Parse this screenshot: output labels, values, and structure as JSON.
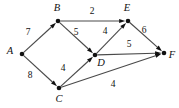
{
  "figure": {
    "type": "directed-weighted-graph",
    "width": 179,
    "height": 108,
    "background": "#ffffff",
    "edge_color": "#4a4a4a",
    "node_color": "#111111"
  },
  "nodes": [
    {
      "id": "A",
      "label": "A",
      "x": 22,
      "y": 54,
      "label_x": 10,
      "label_y": 52
    },
    {
      "id": "B",
      "label": "B",
      "x": 58,
      "y": 21,
      "label_x": 57,
      "label_y": 9
    },
    {
      "id": "C",
      "label": "C",
      "x": 59,
      "y": 88,
      "label_x": 59,
      "label_y": 100
    },
    {
      "id": "D",
      "label": "D",
      "x": 95,
      "y": 55,
      "label_x": 101,
      "label_y": 64
    },
    {
      "id": "E",
      "label": "E",
      "x": 128,
      "y": 21,
      "label_x": 127,
      "label_y": 9
    },
    {
      "id": "F",
      "label": "F",
      "x": 164,
      "y": 53,
      "label_x": 172,
      "label_y": 56
    }
  ],
  "edges": [
    {
      "id": "A-B",
      "from": "A",
      "to": "B",
      "weight": "7",
      "label_x": 28,
      "label_y": 33
    },
    {
      "id": "A-C",
      "from": "A",
      "to": "C",
      "weight": "8",
      "label_x": 30,
      "label_y": 76
    },
    {
      "id": "B-E",
      "from": "B",
      "to": "E",
      "weight": "2",
      "label_x": 92,
      "label_y": 12
    },
    {
      "id": "B-D",
      "from": "B",
      "to": "D",
      "weight": "5",
      "label_x": 76,
      "label_y": 33
    },
    {
      "id": "C-D",
      "from": "C",
      "to": "D",
      "weight": "4",
      "label_x": 63,
      "label_y": 69
    },
    {
      "id": "C-F",
      "from": "C",
      "to": "F",
      "weight": "4",
      "label_x": 113,
      "label_y": 85
    },
    {
      "id": "D-E",
      "from": "D",
      "to": "E",
      "weight": "4",
      "label_x": 105,
      "label_y": 32
    },
    {
      "id": "D-F",
      "from": "D",
      "to": "F",
      "weight": "5",
      "label_x": 129,
      "label_y": 45
    },
    {
      "id": "E-F",
      "from": "E",
      "to": "F",
      "weight": "6",
      "label_x": 144,
      "label_y": 31
    }
  ],
  "chart_data": {
    "type": "diagram",
    "title": "",
    "nodes": [
      "A",
      "B",
      "C",
      "D",
      "E",
      "F"
    ],
    "directed": true,
    "weighted": true,
    "edges": [
      {
        "source": "A",
        "target": "B",
        "weight": 7
      },
      {
        "source": "A",
        "target": "C",
        "weight": 8
      },
      {
        "source": "B",
        "target": "E",
        "weight": 2
      },
      {
        "source": "B",
        "target": "D",
        "weight": 5
      },
      {
        "source": "C",
        "target": "D",
        "weight": 4
      },
      {
        "source": "C",
        "target": "F",
        "weight": 4
      },
      {
        "source": "D",
        "target": "E",
        "weight": 4
      },
      {
        "source": "D",
        "target": "F",
        "weight": 5
      },
      {
        "source": "E",
        "target": "F",
        "weight": 6
      }
    ]
  }
}
